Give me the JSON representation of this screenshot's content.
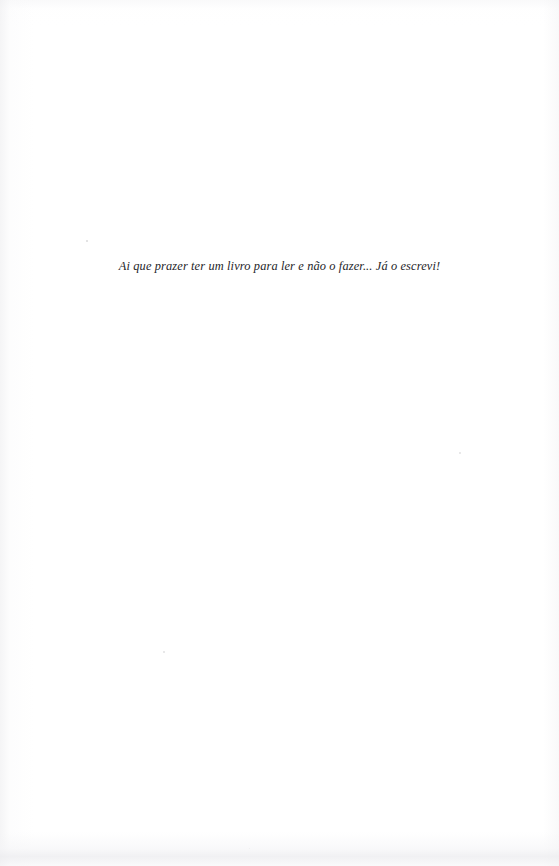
{
  "page": {
    "kind": "scanned-book-page",
    "background_color": "#ffffff",
    "width": 559,
    "height": 866
  },
  "epigraph": {
    "text": "Ai que prazer ter um livro para ler e não o fazer... Já o escrevi!",
    "style": "italic",
    "ink_color": "#26262a",
    "alignment": "center"
  },
  "artifacts": {
    "specks": [
      {
        "name": "speck-above-text",
        "x": 86,
        "y": 240,
        "size": 1.6,
        "color": "#dededf"
      },
      {
        "name": "speck-mid-right",
        "x": 459,
        "y": 452,
        "size": 1.8,
        "color": "#e2e2e3"
      },
      {
        "name": "speck-lower-left",
        "x": 163,
        "y": 651,
        "size": 1.6,
        "color": "#e4e4e5"
      },
      {
        "name": "speck-bottom-center",
        "x": 249,
        "y": 848,
        "size": 1.4,
        "color": "#e6e6e7"
      }
    ],
    "edge_shading": {
      "left_gutter": "#ececee",
      "bottom_band": "#ecece f",
      "top_band": "#f3f3f5"
    }
  }
}
